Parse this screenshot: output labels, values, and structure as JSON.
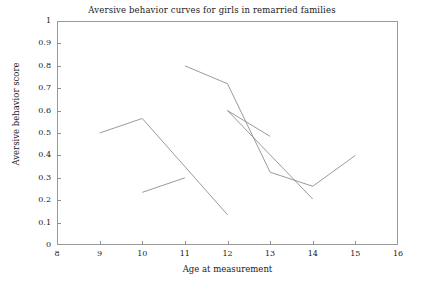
{
  "chart_data": {
    "type": "line",
    "title": "Aversive behavior curves for girls in remarried families",
    "xlabel": "Age at measurement",
    "ylabel": "Aversive behavior score",
    "xlim": [
      8,
      16
    ],
    "ylim": [
      0,
      1
    ],
    "grid": false,
    "legend": "none",
    "xticks": [
      "8",
      "9",
      "10",
      "11",
      "12",
      "13",
      "14",
      "15",
      "16"
    ],
    "xtick_values": [
      8,
      9,
      10,
      11,
      12,
      13,
      14,
      15,
      16
    ],
    "yticks": [
      "0",
      "0.1",
      "0.2",
      "0.3",
      "0.4",
      "0.5",
      "0.6",
      "0.7",
      "0.8",
      "0.9",
      "1"
    ],
    "ytick_values": [
      0,
      0.1,
      0.2,
      0.3,
      0.4,
      0.5,
      0.6,
      0.7,
      0.8,
      0.9,
      1
    ],
    "line_color": "#808080",
    "series": [
      {
        "name": "curve-1",
        "x": [
          9,
          10,
          12
        ],
        "values": [
          0.5,
          0.565,
          0.135
        ]
      },
      {
        "name": "curve-2",
        "x": [
          10,
          11
        ],
        "values": [
          0.235,
          0.3
        ]
      },
      {
        "name": "curve-3",
        "x": [
          11,
          12,
          13,
          14,
          15
        ],
        "values": [
          0.8,
          0.72,
          0.325,
          0.262,
          0.4
        ]
      },
      {
        "name": "curve-4",
        "x": [
          12,
          13
        ],
        "values": [
          0.6,
          0.485
        ]
      },
      {
        "name": "curve-5",
        "x": [
          12,
          14
        ],
        "values": [
          0.6,
          0.205
        ]
      }
    ]
  }
}
